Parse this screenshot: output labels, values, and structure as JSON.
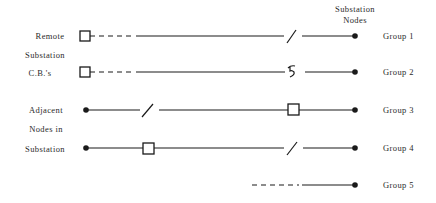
{
  "header": {
    "nodes_label_line1": "Substation",
    "nodes_label_line2": "Nodes"
  },
  "left_labels": {
    "remote": [
      "Remote",
      "Substation",
      "C.B.'s"
    ],
    "adjacent": [
      "Adjacent",
      "Nodes in",
      "Substation"
    ]
  },
  "groups": [
    {
      "label": "Group 1",
      "left_end": "circuit-breaker",
      "segments": [
        "dashed",
        "solid",
        "open-switch",
        "solid"
      ],
      "right_end": "substation-node"
    },
    {
      "label": "Group 2",
      "left_end": "circuit-breaker",
      "segments": [
        "dashed",
        "solid",
        "fault-symbol",
        "solid"
      ],
      "right_end": "substation-node"
    },
    {
      "label": "Group 3",
      "left_end": "node",
      "segments": [
        "solid",
        "open-switch",
        "solid",
        "circuit-breaker",
        "solid"
      ],
      "right_end": "substation-node"
    },
    {
      "label": "Group 4",
      "left_end": "node",
      "segments": [
        "solid",
        "circuit-breaker",
        "solid",
        "open-switch",
        "solid"
      ],
      "right_end": "substation-node"
    },
    {
      "label": "Group 5",
      "left_end": "none",
      "segments": [
        "dashed",
        "solid"
      ],
      "right_end": "substation-node"
    }
  ]
}
